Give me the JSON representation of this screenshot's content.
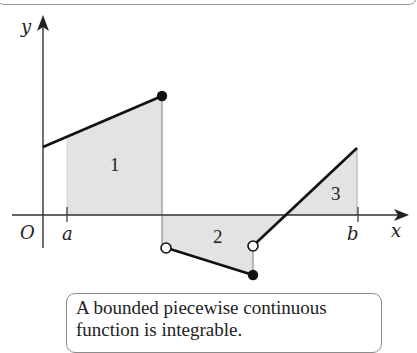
{
  "figure": {
    "axes": {
      "x_label": "x",
      "y_label": "y",
      "origin_label": "O",
      "tick_a_label": "a",
      "tick_b_label": "b"
    },
    "regions": [
      {
        "label": "1",
        "sign": "positive"
      },
      {
        "label": "2",
        "sign": "negative"
      },
      {
        "label": "3",
        "sign": "positive"
      }
    ],
    "colors": {
      "shade": "#e3e3e3",
      "line": "#111111",
      "axis": "#333333"
    },
    "caption_lines": [
      "A bounded piecewise continuous",
      "function is integrable."
    ]
  }
}
